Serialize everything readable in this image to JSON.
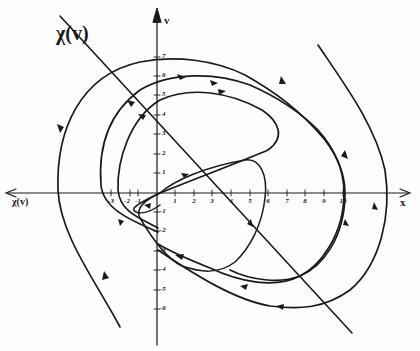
{
  "figure": {
    "type": "phase-plane diagram",
    "colors": {
      "background": "#fdfdfd",
      "ink": "#1a1a1a"
    },
    "labels": {
      "chi_line": "χ(v)",
      "x_axis_right": "x",
      "x_axis_left": "χ(v)",
      "y_axis": "v"
    },
    "x_ticks": [
      {
        "value": "-3",
        "px": 111
      },
      {
        "value": "-2",
        "px": 130
      },
      {
        "value": "-1",
        "px": 138
      },
      {
        "value": "1",
        "px": 175
      },
      {
        "value": "2",
        "px": 194
      },
      {
        "value": "3",
        "px": 212
      },
      {
        "value": "4",
        "px": 231
      },
      {
        "value": "5",
        "px": 250
      },
      {
        "value": "6",
        "px": 268
      },
      {
        "value": "7",
        "px": 287
      },
      {
        "value": "8",
        "px": 305
      },
      {
        "value": "9",
        "px": 324
      },
      {
        "value": "10",
        "px": 343
      }
    ],
    "y_ticks": [
      {
        "value": "7",
        "py": 57
      },
      {
        "value": "6",
        "py": 76
      },
      {
        "value": "5",
        "py": 95
      },
      {
        "value": "4",
        "py": 115
      },
      {
        "value": "3",
        "py": 134
      },
      {
        "value": "2",
        "py": 154
      },
      {
        "value": "1",
        "py": 173
      },
      {
        "value": "-1",
        "py": 212
      },
      {
        "value": "-2",
        "py": 231
      },
      {
        "value": "-3",
        "py": 251
      },
      {
        "value": "-4",
        "py": 270
      },
      {
        "value": "-5",
        "py": 290
      },
      {
        "value": "-6",
        "py": 309
      }
    ],
    "curves": [
      {
        "name": "chi-line",
        "description": "straight switching line χ(v)"
      },
      {
        "name": "outer-trajectory-left",
        "description": "open trajectory entering from lower left, arcing over the top"
      },
      {
        "name": "outer-trajectory-right",
        "description": "open trajectory entering from upper right, arcing below"
      },
      {
        "name": "middle-trajectory",
        "description": "closed-like spiral through x≈-3 and x≈10"
      },
      {
        "name": "inner-trajectory",
        "description": "spiral through x≈-2 and x≈6"
      },
      {
        "name": "innermost-trajectory",
        "description": "loop from origin through x≈5.5"
      }
    ]
  }
}
